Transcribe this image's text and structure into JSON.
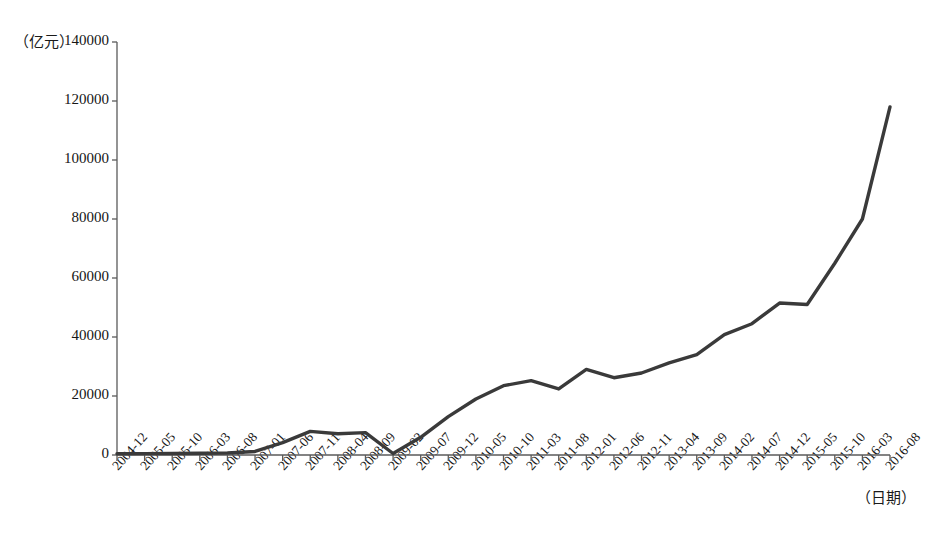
{
  "chart_data": {
    "type": "line",
    "title": "",
    "subtitle": "",
    "xlabel": "（日期）",
    "ylabel": "（亿元）",
    "ylim": [
      0,
      140000
    ],
    "ytick_labels": [
      "0",
      "20000",
      "40000",
      "60000",
      "80000",
      "100000",
      "120000",
      "140000"
    ],
    "ytick_values": [
      0,
      20000,
      40000,
      60000,
      80000,
      100000,
      120000,
      140000
    ],
    "grid": false,
    "legend": null,
    "legend_position": "none",
    "line_color": "#3a3a3a",
    "line_width": 3.4,
    "categories": [
      "2004-12",
      "2005-05",
      "2005-10",
      "2006-03",
      "2006-08",
      "2007-01",
      "2007-06",
      "2007-11",
      "2008-04",
      "2008-09",
      "2009-02",
      "2009-07",
      "2009-12",
      "2010-05",
      "2010-10",
      "2011-03",
      "2011-08",
      "2012-01",
      "2012-06",
      "2012-11",
      "2013-04",
      "2013-09",
      "2014-02",
      "2014-07",
      "2014-12",
      "2015-05",
      "2015-10",
      "2016-03",
      "2016-08"
    ],
    "series": [
      {
        "name": "规模",
        "values": [
          400,
          450,
          500,
          600,
          700,
          1200,
          4200,
          8000,
          7200,
          7600,
          500,
          6000,
          13000,
          19000,
          23500,
          25200,
          22400,
          29000,
          26200,
          27800,
          31200,
          34000,
          40800,
          44500,
          51500,
          51000,
          65000,
          80000,
          118000
        ]
      }
    ],
    "x_axis_px": {
      "left": 117,
      "right": 890
    },
    "y_axis_px": {
      "bottom": 455,
      "top": 42
    }
  }
}
